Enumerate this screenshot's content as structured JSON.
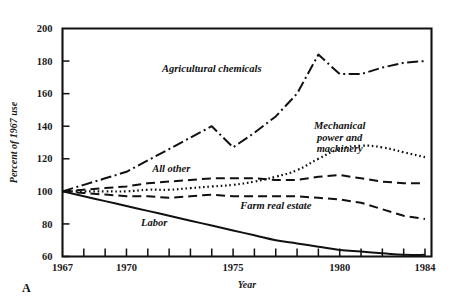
{
  "chart_data": {
    "type": "line",
    "title": "",
    "xlabel": "Year",
    "ylabel": "Percent of 1967 use",
    "panel_letter": "A",
    "xlim": [
      1967,
      1984
    ],
    "ylim": [
      60,
      200
    ],
    "yticks": [
      60,
      80,
      100,
      120,
      140,
      160,
      180,
      200
    ],
    "ytick_labels": [
      "60",
      "80",
      "100",
      "120",
      "140",
      "160",
      "180",
      "200"
    ],
    "xticks": [
      1967,
      1968,
      1969,
      1970,
      1971,
      1972,
      1973,
      1974,
      1975,
      1976,
      1977,
      1978,
      1979,
      1980,
      1981,
      1982,
      1983,
      1984
    ],
    "xtick_labels": [
      "1967",
      "1970",
      "1975",
      "1980",
      "1984"
    ],
    "xtick_label_years": [
      1967,
      1970,
      1975,
      1980,
      1984
    ],
    "grid": false,
    "legend_position": "inline-annotations",
    "x": [
      1967,
      1968,
      1969,
      1970,
      1971,
      1972,
      1973,
      1974,
      1975,
      1976,
      1977,
      1978,
      1979,
      1980,
      1981,
      1982,
      1983,
      1984
    ],
    "series": [
      {
        "name": "Agricultural chemicals",
        "label": "Agricultural chemicals",
        "style": "dash-dot",
        "values": [
          100,
          104,
          108,
          112,
          119,
          126,
          133,
          140,
          127,
          136,
          146,
          160,
          184,
          172,
          172,
          176,
          179,
          180
        ]
      },
      {
        "name": "Mechanical power and machinery",
        "label": "Mechanical power and machinery",
        "style": "dotted",
        "values": [
          100,
          100,
          100,
          100,
          101,
          101,
          102,
          103,
          104,
          106,
          109,
          113,
          120,
          126,
          128,
          127,
          124,
          121
        ]
      },
      {
        "name": "All other",
        "label": "All other",
        "style": "dashed",
        "values": [
          100,
          101,
          102,
          103,
          105,
          106,
          107,
          108,
          108,
          108,
          107,
          107,
          109,
          110,
          108,
          106,
          105,
          105
        ]
      },
      {
        "name": "Farm real estate",
        "label": "Farm real estate",
        "style": "dashed",
        "values": [
          100,
          99,
          98,
          97,
          97,
          96,
          97,
          98,
          97,
          97,
          97,
          97,
          96,
          95,
          93,
          89,
          85,
          83
        ]
      },
      {
        "name": "Labor",
        "label": "Labor",
        "style": "solid",
        "values": [
          100,
          97,
          94,
          91,
          88,
          85,
          82,
          79,
          76,
          73,
          70,
          68,
          66,
          64,
          63,
          62,
          61,
          61
        ]
      }
    ],
    "annotations": [
      {
        "text": "Agricultural chemicals",
        "x": 1974.0,
        "y": 173,
        "anchor": "middle"
      },
      {
        "text": "Mechanical",
        "x": 1980.0,
        "y": 138,
        "anchor": "middle"
      },
      {
        "text": "power and",
        "x": 1980.0,
        "y": 131,
        "anchor": "middle"
      },
      {
        "text": "machinery",
        "x": 1980.0,
        "y": 124,
        "anchor": "middle"
      },
      {
        "text": "All other",
        "x": 1972.1,
        "y": 112,
        "anchor": "middle"
      },
      {
        "text": "Farm real estate",
        "x": 1977.0,
        "y": 89,
        "anchor": "middle"
      },
      {
        "text": "Labor",
        "x": 1971.3,
        "y": 79,
        "anchor": "middle"
      }
    ]
  }
}
